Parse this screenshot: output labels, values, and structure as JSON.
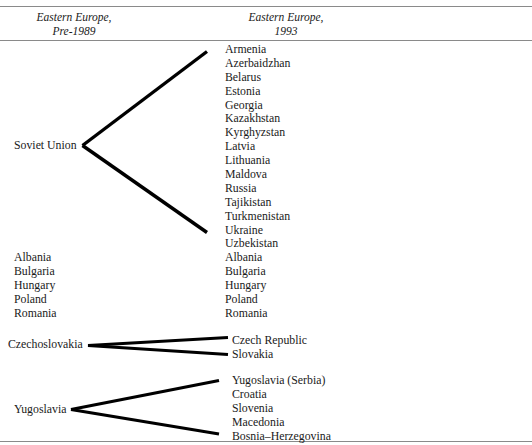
{
  "figure": {
    "type": "fan-diagram"
  },
  "columns": {
    "left": {
      "heading_line1": "Eastern Europe,",
      "heading_line2": "Pre-1989"
    },
    "right": {
      "heading_line1": "Eastern Europe,",
      "heading_line2": "1993"
    }
  },
  "groups": {
    "soviet_union": {
      "source": "Soviet Union",
      "successors": [
        "Armenia",
        "Azerbaidzhan",
        "Belarus",
        "Estonia",
        "Georgia",
        "Kazakhstan",
        "Kyrghyzstan",
        "Latvia",
        "Lithuania",
        "Maldova",
        "Russia",
        "Tajikistan",
        "Turkmenistan",
        "Ukraine",
        "Uzbekistan"
      ]
    },
    "unchanged": {
      "before": [
        "Albania",
        "Bulgaria",
        "Hungary",
        "Poland",
        "Romania"
      ],
      "after": [
        "Albania",
        "Bulgaria",
        "Hungary",
        "Poland",
        "Romania"
      ]
    },
    "czechoslovakia": {
      "source": "Czechoslovakia",
      "successors": [
        "Czech Republic",
        "Slovakia"
      ]
    },
    "yugoslavia": {
      "source": "Yugoslavia",
      "successors": [
        "Yugoslavia (Serbia)",
        "Croatia",
        "Slovenia",
        "Macedonia",
        "Bosnia–Herzegovina"
      ]
    }
  },
  "style": {
    "rule_color": "#8a8a8a",
    "connector_color": "#000000",
    "text_color": "#1a1a1a",
    "background": "#ffffff"
  }
}
